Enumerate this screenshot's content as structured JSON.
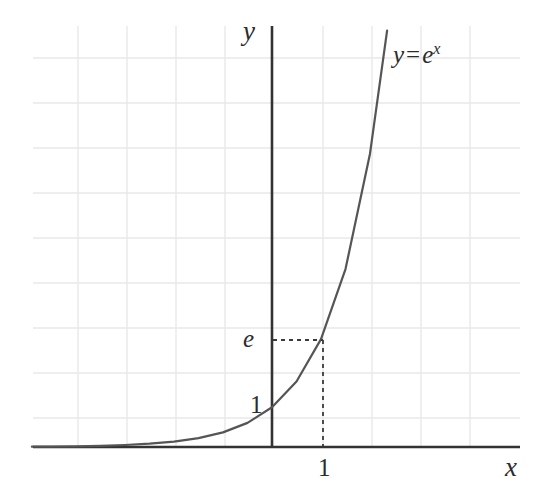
{
  "figure": {
    "kind": "math-function-plot",
    "background_color": "#ffffff",
    "axis_color": "#333333",
    "curve_color": "#555555",
    "grid_color": "#e8e8ea",
    "dash_color": "#3a3a3a",
    "text_color": "#2b2b2b"
  },
  "labels": {
    "y_axis": "y",
    "x_axis": "x",
    "curve_base": "y",
    "curve_equals": "=",
    "curve_function_base": "e",
    "curve_function_exponent": "x",
    "curve_full": "y = e^x",
    "y_value_e": "e",
    "y_value_one": "1",
    "x_value_one": "1"
  },
  "chart_data": {
    "type": "line",
    "title": "",
    "subtitle": "",
    "xlabel": "x",
    "ylabel": "y",
    "function": "y = e^x",
    "legend_position": "inline-near-curve",
    "grid": true,
    "grid_minor": false,
    "xlim": [
      -4.9,
      5.05
    ],
    "ylim": [
      -0.1,
      10.6
    ],
    "x_ticks": [
      1
    ],
    "x_tick_labels": [
      "1"
    ],
    "y_ticks": [
      1,
      2.718
    ],
    "y_tick_labels": [
      "1",
      "e"
    ],
    "axis_origin_px": {
      "x": 272,
      "y": 447
    },
    "pixels_per_x_unit": 49,
    "pixels_per_y_unit": 39.7,
    "annotations": [
      {
        "name": "dashed-horizontal-to-e",
        "from": {
          "x": 0,
          "y": 2.718
        },
        "to": {
          "x": 1,
          "y": 2.718
        },
        "style": "dashed"
      },
      {
        "name": "dashed-vertical-to-one",
        "from": {
          "x": 1,
          "y": 2.718
        },
        "to": {
          "x": 1,
          "y": 0
        },
        "style": "dashed"
      }
    ],
    "series": [
      {
        "name": "y = e^x",
        "color": "#555555",
        "points": [
          {
            "x": -4.9,
            "y": 0.0074
          },
          {
            "x": -4.5,
            "y": 0.0111
          },
          {
            "x": -4.0,
            "y": 0.0183
          },
          {
            "x": -3.5,
            "y": 0.0302
          },
          {
            "x": -3.0,
            "y": 0.0498
          },
          {
            "x": -2.5,
            "y": 0.0821
          },
          {
            "x": -2.0,
            "y": 0.1353
          },
          {
            "x": -1.5,
            "y": 0.2231
          },
          {
            "x": -1.0,
            "y": 0.3679
          },
          {
            "x": -0.5,
            "y": 0.6065
          },
          {
            "x": 0.0,
            "y": 1.0
          },
          {
            "x": 0.5,
            "y": 1.6487
          },
          {
            "x": 1.0,
            "y": 2.7183
          },
          {
            "x": 1.5,
            "y": 4.4817
          },
          {
            "x": 2.0,
            "y": 7.3891
          },
          {
            "x": 2.35,
            "y": 10.4856
          }
        ]
      }
    ],
    "gridlines": {
      "vertical_x_px": [
        78,
        127,
        176,
        225,
        323,
        372,
        421,
        470
      ],
      "horizontal_y_px": [
        58,
        103,
        148,
        193,
        238,
        283,
        328,
        373,
        418
      ]
    }
  }
}
